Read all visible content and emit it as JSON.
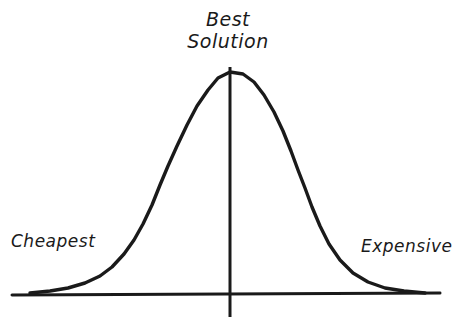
{
  "diagram": {
    "title_lines": [
      "Best",
      "Solution"
    ],
    "left_label": "Cheapest",
    "right_label": "Expensive",
    "style": {
      "background_color": "#ffffff",
      "ink_color": "#1a1a1a",
      "stroke_width": 3
    }
  },
  "chart_data": {
    "type": "line",
    "title": "Best Solution",
    "subtitle": "",
    "xlabel": "",
    "ylabel": "",
    "grid": false,
    "legend_position": "none",
    "axis": {
      "x_axis_y": 294,
      "x_axis_start_x": 12,
      "x_axis_end_x": 440,
      "vertical_line_x": 230,
      "vertical_line_top_y": 67,
      "vertical_line_bottom_y": 317
    },
    "annotations": [
      {
        "text": "Best Solution",
        "x": 230,
        "y": 28,
        "role": "peak-label"
      },
      {
        "text": "Cheapest",
        "x": 55,
        "y": 243,
        "role": "left-tail-label"
      },
      {
        "text": "Expensive",
        "x": 405,
        "y": 248,
        "role": "right-tail-label"
      }
    ],
    "series": [
      {
        "name": "cost-benefit bell curve",
        "points": [
          [
            30,
            293
          ],
          [
            50,
            291
          ],
          [
            68,
            288
          ],
          [
            85,
            283
          ],
          [
            100,
            276
          ],
          [
            112,
            267
          ],
          [
            124,
            254
          ],
          [
            134,
            240
          ],
          [
            143,
            224
          ],
          [
            152,
            205
          ],
          [
            160,
            185
          ],
          [
            168,
            166
          ],
          [
            177,
            146
          ],
          [
            187,
            125
          ],
          [
            197,
            106
          ],
          [
            208,
            90
          ],
          [
            218,
            78
          ],
          [
            230,
            72
          ],
          [
            243,
            74
          ],
          [
            254,
            82
          ],
          [
            264,
            95
          ],
          [
            274,
            112
          ],
          [
            283,
            131
          ],
          [
            291,
            151
          ],
          [
            298,
            170
          ],
          [
            305,
            188
          ],
          [
            312,
            207
          ],
          [
            320,
            226
          ],
          [
            329,
            244
          ],
          [
            340,
            260
          ],
          [
            353,
            273
          ],
          [
            368,
            282
          ],
          [
            385,
            288
          ],
          [
            404,
            291
          ],
          [
            425,
            293
          ]
        ]
      }
    ],
    "xlim": [
      0,
      456
    ],
    "ylim": [
      327,
      0
    ]
  }
}
